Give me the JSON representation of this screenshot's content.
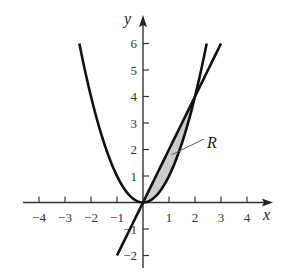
{
  "chart_data": {
    "type": "line",
    "title": "",
    "xlabel": "x",
    "ylabel": "y",
    "xlim": [
      -4.6,
      4.9
    ],
    "ylim": [
      -2.5,
      6.9
    ],
    "grid": false,
    "x_ticks": [
      -4,
      -3,
      -2,
      -1,
      1,
      2,
      3,
      4
    ],
    "x_tick_labels": [
      "−4",
      "−3",
      "−2",
      "−1",
      "1",
      "2",
      "3",
      "4"
    ],
    "y_ticks": [
      -2,
      -1,
      1,
      2,
      3,
      4,
      5,
      6
    ],
    "y_tick_labels": [
      "−2",
      "−1",
      "1",
      "2",
      "3",
      "4",
      "5",
      "6"
    ],
    "series": [
      {
        "name": "y = x^2",
        "kind": "parabola",
        "x_range": [
          -2.449,
          2.449
        ],
        "x": [
          -2.449,
          -2,
          -1.5,
          -1,
          -0.5,
          0,
          0.5,
          1,
          1.5,
          2,
          2.449
        ],
        "y": [
          6,
          4,
          2.25,
          1,
          0.25,
          0,
          0.25,
          1,
          2.25,
          4,
          6
        ]
      },
      {
        "name": "y = 2x",
        "kind": "line",
        "x_range": [
          -1,
          3
        ],
        "x": [
          -1,
          0,
          1,
          2,
          3
        ],
        "y": [
          -2,
          0,
          2,
          4,
          6
        ]
      }
    ],
    "shaded_region": {
      "label": "R",
      "between": [
        "y = 2x",
        "y = x^2"
      ],
      "x_range": [
        0,
        2
      ],
      "intersections": [
        [
          0,
          0
        ],
        [
          2,
          4
        ]
      ],
      "fill": "#cccccc"
    },
    "annotations": [
      {
        "text": "R",
        "points_to": [
          1.1,
          1.8
        ]
      }
    ]
  }
}
